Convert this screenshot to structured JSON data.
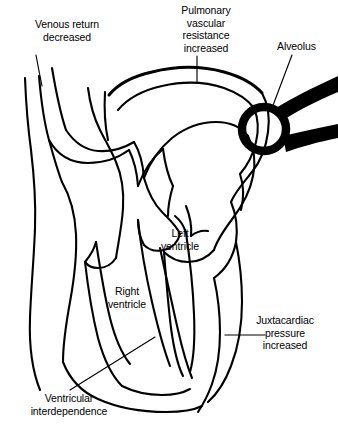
{
  "figure": {
    "type": "anatomical-line-diagram",
    "background_color": "#ffffff",
    "ink_color": "#000000"
  },
  "annotations": [
    {
      "id": "venous-return",
      "text": "Venous return\ndecreased",
      "align": "center",
      "x": 14,
      "y": 18
    },
    {
      "id": "pulmonary-vascular-resistance",
      "text": "Pulmonary\nvascular\nresistance\nincreased",
      "align": "center",
      "x": 160,
      "y": 4
    },
    {
      "id": "alveolus",
      "text": "Alveolus",
      "align": "left",
      "x": 277,
      "y": 40
    },
    {
      "id": "left-ventricle",
      "text": "Left\nventricle",
      "align": "center",
      "x": 152,
      "y": 227
    },
    {
      "id": "right-ventricle",
      "text": "Right\nventricle",
      "align": "center",
      "x": 97,
      "y": 285
    },
    {
      "id": "juxtacardiac-pressure",
      "text": "Juxtacardiac\npressure\nincreased",
      "align": "center",
      "x": 246,
      "y": 314
    },
    {
      "id": "ventricular-interdependence",
      "text": "Ventricular\ninterdependence",
      "align": "center",
      "x": 14,
      "y": 392
    }
  ]
}
